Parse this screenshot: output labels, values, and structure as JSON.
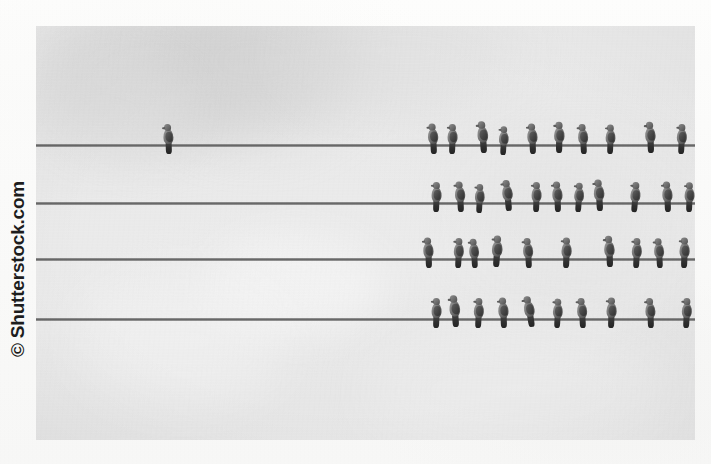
{
  "page": {
    "media_type": "scanned-book-page-photograph",
    "background_color": "#faf9f8"
  },
  "watermark": {
    "text": "© Shutterstock.com",
    "symbol": "©",
    "brand": "Shutterstock.com",
    "orientation": "vertical-rotated-90-ccw",
    "color": "#1d1d1d"
  },
  "photo": {
    "caption": "Pigeons perched on four horizontal utility wires against an overcast sky",
    "sky_color": "#eaeaea",
    "wire_color": "#5a5a5a",
    "bird_color": "#5c5c5c",
    "left": 36,
    "top": 26,
    "width": 659,
    "height": 414
  },
  "clouds": [
    {
      "left": 8,
      "top": -26,
      "width": 230,
      "height": 150,
      "color": "rgba(214,214,214,0.55)",
      "blur": 22
    },
    {
      "left": 118,
      "top": -40,
      "width": 200,
      "height": 150,
      "color": "rgba(206,206,206,0.50)",
      "blur": 26
    },
    {
      "left": -18,
      "top": 30,
      "width": 170,
      "height": 110,
      "color": "rgba(219,219,219,0.45)",
      "blur": 20
    },
    {
      "left": 250,
      "top": -34,
      "width": 240,
      "height": 120,
      "color": "rgba(222,222,222,0.40)",
      "blur": 24
    },
    {
      "left": 170,
      "top": 210,
      "width": 180,
      "height": 100,
      "color": "rgba(246,246,246,0.60)",
      "blur": 20
    },
    {
      "left": 40,
      "top": 250,
      "width": 210,
      "height": 130,
      "color": "rgba(243,243,243,0.50)",
      "blur": 24
    },
    {
      "left": 430,
      "top": 120,
      "width": 230,
      "height": 160,
      "color": "rgba(226,226,226,0.38)",
      "blur": 26
    },
    {
      "left": 330,
      "top": 300,
      "width": 300,
      "height": 130,
      "color": "rgba(240,240,240,0.42)",
      "blur": 26
    }
  ],
  "wires": [
    {
      "id": "wire-1",
      "y": 144,
      "label": "Wire 1 (top)",
      "bird_count": 11
    },
    {
      "id": "wire-2",
      "y": 202,
      "label": "Wire 2 (upper middle)",
      "bird_count": 11
    },
    {
      "id": "wire-3",
      "y": 258,
      "label": "Wire 3 (lower middle)",
      "bird_count": 10
    },
    {
      "id": "wire-4",
      "y": 318,
      "label": "Wire 4 (bottom)",
      "bird_count": 10
    }
  ],
  "birds": {
    "total_count": 42,
    "row1": [
      {
        "x": 163,
        "lean": -2,
        "scale": 1.0
      },
      {
        "x": 428,
        "lean": -3,
        "scale": 1.02
      },
      {
        "x": 446,
        "lean": 2,
        "scale": 1.0
      },
      {
        "x": 478,
        "lean": -4,
        "scale": 1.06
      },
      {
        "x": 497,
        "lean": 3,
        "scale": 0.96
      },
      {
        "x": 527,
        "lean": -2,
        "scale": 1.02
      },
      {
        "x": 553,
        "lean": 1,
        "scale": 1.04
      },
      {
        "x": 578,
        "lean": -3,
        "scale": 1.0
      },
      {
        "x": 604,
        "lean": 2,
        "scale": 0.98
      },
      {
        "x": 645,
        "lean": -2,
        "scale": 1.04
      },
      {
        "x": 675,
        "lean": 3,
        "scale": 1.0
      }
    ],
    "row2": [
      {
        "x": 430,
        "lean": 2,
        "scale": 1.0
      },
      {
        "x": 455,
        "lean": -3,
        "scale": 1.02
      },
      {
        "x": 473,
        "lean": 3,
        "scale": 0.97
      },
      {
        "x": 503,
        "lean": -5,
        "scale": 1.04
      },
      {
        "x": 530,
        "lean": 2,
        "scale": 1.0
      },
      {
        "x": 552,
        "lean": -2,
        "scale": 1.02
      },
      {
        "x": 572,
        "lean": 4,
        "scale": 0.98
      },
      {
        "x": 594,
        "lean": -3,
        "scale": 1.05
      },
      {
        "x": 628,
        "lean": 5,
        "scale": 1.0
      },
      {
        "x": 662,
        "lean": -2,
        "scale": 1.02
      },
      {
        "x": 683,
        "lean": 2,
        "scale": 0.99
      }
    ],
    "row3": [
      {
        "x": 423,
        "lean": -2,
        "scale": 1.02
      },
      {
        "x": 452,
        "lean": 3,
        "scale": 1.0
      },
      {
        "x": 469,
        "lean": -3,
        "scale": 0.98
      },
      {
        "x": 490,
        "lean": 4,
        "scale": 1.05
      },
      {
        "x": 523,
        "lean": -3,
        "scale": 1.0
      },
      {
        "x": 560,
        "lean": 2,
        "scale": 1.02
      },
      {
        "x": 604,
        "lean": -2,
        "scale": 1.04
      },
      {
        "x": 630,
        "lean": 3,
        "scale": 1.0
      },
      {
        "x": 654,
        "lean": -3,
        "scale": 0.99
      },
      {
        "x": 678,
        "lean": 2,
        "scale": 1.02
      }
    ],
    "row4": [
      {
        "x": 430,
        "lean": 2,
        "scale": 1.0
      },
      {
        "x": 450,
        "lean": -4,
        "scale": 1.06
      },
      {
        "x": 472,
        "lean": 3,
        "scale": 1.0
      },
      {
        "x": 498,
        "lean": -2,
        "scale": 1.02
      },
      {
        "x": 526,
        "lean": -9,
        "scale": 1.04
      },
      {
        "x": 551,
        "lean": 3,
        "scale": 0.98
      },
      {
        "x": 577,
        "lean": -3,
        "scale": 1.0
      },
      {
        "x": 605,
        "lean": 2,
        "scale": 1.02
      },
      {
        "x": 645,
        "lean": -2,
        "scale": 1.0
      },
      {
        "x": 680,
        "lean": 3,
        "scale": 1.0
      }
    ]
  },
  "bleed_text": [
    {
      "text": "Nesting site",
      "left": 300,
      "top": 30,
      "size": 15,
      "opacity": 0.055
    },
    {
      "text": "Insect Survey",
      "left": 282,
      "top": 80,
      "size": 14,
      "opacity": 0.05
    },
    {
      "text": "the sites",
      "left": 330,
      "top": 104,
      "size": 12,
      "opacity": 0.045
    },
    {
      "text": "al colonies and",
      "left": 298,
      "top": 180,
      "size": 13,
      "opacity": 0.055
    },
    {
      "text": "the best",
      "left": 360,
      "top": 202,
      "size": 12,
      "opacity": 0.048
    },
    {
      "text": "Y one of the",
      "left": 585,
      "top": 268,
      "size": 13,
      "opacity": 0.05
    },
    {
      "text": "practices for",
      "left": 592,
      "top": 350,
      "size": 15,
      "opacity": 0.06
    },
    {
      "text": "the place",
      "left": 606,
      "top": 382,
      "size": 14,
      "opacity": 0.055
    },
    {
      "text": "colonies are at",
      "left": 596,
      "top": 414,
      "size": 11,
      "opacity": 0.04
    },
    {
      "text": "the wire",
      "left": 80,
      "top": 404,
      "size": 11,
      "opacity": 0.035
    }
  ]
}
